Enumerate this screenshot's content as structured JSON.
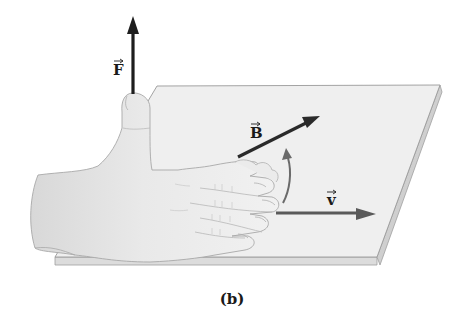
{
  "figure": {
    "caption": "(b)",
    "vectors": [
      {
        "id": "F",
        "label": "F",
        "description": "force, points up along thumb",
        "color": "#1e1e1e"
      },
      {
        "id": "B",
        "label": "B",
        "description": "magnetic field, points diagonally back along plane",
        "color": "#2a2a2a"
      },
      {
        "id": "v",
        "label": "v",
        "description": "velocity, points right along fingers",
        "color": "#5a5a5a"
      }
    ],
    "rotation_arrow": {
      "description": "curved arrow from v toward B",
      "color": "#6a6a6a"
    },
    "colors": {
      "plane_top": "#efefef",
      "plane_edge": "#dcdcdc",
      "plane_outline": "#9a9a9a",
      "hand_fill": "#e6e6e6",
      "hand_outline": "#a8a8a8",
      "background": "#ffffff"
    }
  }
}
